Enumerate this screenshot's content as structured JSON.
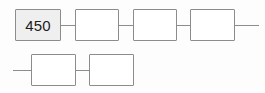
{
  "diagram": {
    "type": "linear-chain",
    "background_color": "#fdfdfd",
    "border_color": "#8c8c8c",
    "fill_color_default": "#ffffff",
    "fill_color_highlight": "#efefef",
    "text_color": "#1b1b1b",
    "rows": 2,
    "nodes": [
      {
        "id": "node-1",
        "label": "450",
        "filled": true,
        "row": 1,
        "x": 15,
        "y": 9,
        "w": 46,
        "h": 32
      },
      {
        "id": "node-2",
        "label": "",
        "filled": false,
        "row": 1,
        "x": 75,
        "y": 9,
        "w": 44,
        "h": 32
      },
      {
        "id": "node-3",
        "label": "",
        "filled": false,
        "row": 1,
        "x": 133,
        "y": 9,
        "w": 44,
        "h": 32
      },
      {
        "id": "node-4",
        "label": "",
        "filled": false,
        "row": 1,
        "x": 190,
        "y": 9,
        "w": 45,
        "h": 32
      },
      {
        "id": "node-5",
        "label": "",
        "filled": false,
        "row": 2,
        "x": 31,
        "y": 54,
        "w": 45,
        "h": 32
      },
      {
        "id": "node-6",
        "label": "",
        "filled": false,
        "row": 2,
        "x": 89,
        "y": 54,
        "w": 45,
        "h": 32
      }
    ],
    "connectors": [
      {
        "id": "connector-1-2",
        "x": 61,
        "y": 25,
        "w": 14
      },
      {
        "id": "connector-2-3",
        "x": 119,
        "y": 25,
        "w": 14
      },
      {
        "id": "connector-3-4",
        "x": 177,
        "y": 25,
        "w": 13
      },
      {
        "id": "connector-5-6",
        "x": 76,
        "y": 70,
        "w": 13
      }
    ],
    "wrap_lines": [
      {
        "id": "wrap-out-right",
        "x": 235,
        "y": 25,
        "w": 24
      },
      {
        "id": "wrap-in-left",
        "x": 13,
        "y": 70,
        "w": 18
      }
    ]
  }
}
